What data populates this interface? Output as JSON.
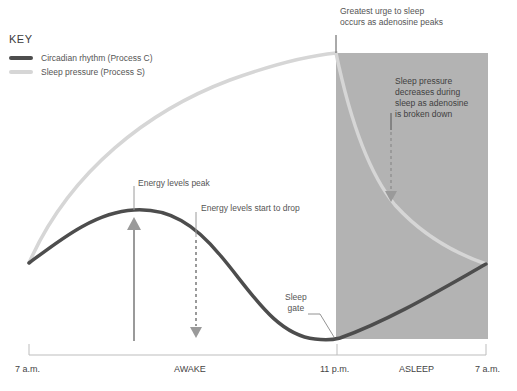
{
  "key": {
    "title": "KEY",
    "items": [
      {
        "label": "Circadian rhythm (Process C)",
        "color": "#4d4d4d"
      },
      {
        "label": "Sleep pressure (Process S)",
        "color": "#d6d6d6"
      }
    ]
  },
  "annotations": {
    "greatest_urge_line1": "Greatest urge to sleep",
    "greatest_urge_line2": "occurs as adenosine peaks",
    "pressure_decrease_line1": "Sleep pressure",
    "pressure_decrease_line2": "decreases during",
    "pressure_decrease_line3": "sleep as adenosine",
    "pressure_decrease_line4": "is broken down",
    "energy_peak": "Energy levels peak",
    "energy_drop": "Energy levels start to drop",
    "sleep_gate_line1": "Sleep",
    "sleep_gate_line2": "gate"
  },
  "axis": {
    "ticks": [
      "7 a.m.",
      "11 p.m.",
      "7 a.m."
    ],
    "periods": [
      "AWAKE",
      "ASLEEP"
    ]
  },
  "colors": {
    "circadian": "#4d4d4d",
    "sleep_pressure": "#d6d6d6",
    "asleep_shade": "#b3b3b3",
    "arrow": "#9a9a9a"
  }
}
